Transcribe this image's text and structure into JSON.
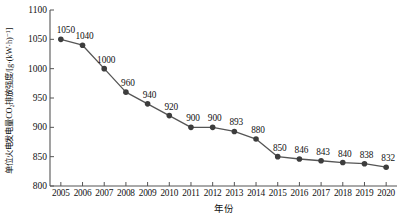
{
  "chart_data": {
    "type": "line",
    "title": "",
    "xlabel": "年份",
    "ylabel": "单位火电发电量CO₂排放强度/[g·(kW·h)⁻¹]",
    "categories": [
      "2005",
      "2006",
      "2007",
      "2008",
      "2009",
      "2010",
      "2011",
      "2012",
      "2013",
      "2014",
      "2015",
      "2016",
      "2017",
      "2018",
      "2019",
      "2020"
    ],
    "values": [
      1050,
      1040,
      1000,
      960,
      940,
      920,
      900,
      900,
      893,
      880,
      850,
      846,
      843,
      840,
      838,
      832
    ],
    "point_labels": [
      "1050",
      "1040",
      "1000",
      "960",
      "940",
      "920",
      "900",
      "900",
      "893",
      "880",
      "850",
      "846",
      "843",
      "840",
      "838",
      "832"
    ],
    "ylim": [
      800,
      1100
    ],
    "yticks": [
      800,
      850,
      900,
      950,
      1000,
      1050,
      1100
    ],
    "ytick_labels": [
      "800",
      "850",
      "900",
      "950",
      "1000",
      "1050",
      "1100"
    ],
    "xlim": [
      2004.5,
      2020.5
    ],
    "grid": false,
    "legend": "none",
    "series_name": "单位火电发电量CO₂排放强度",
    "line_color": "#555555",
    "marker_color": "#3d3d3d",
    "axis_color": "#555555",
    "text_color": "#111111"
  }
}
